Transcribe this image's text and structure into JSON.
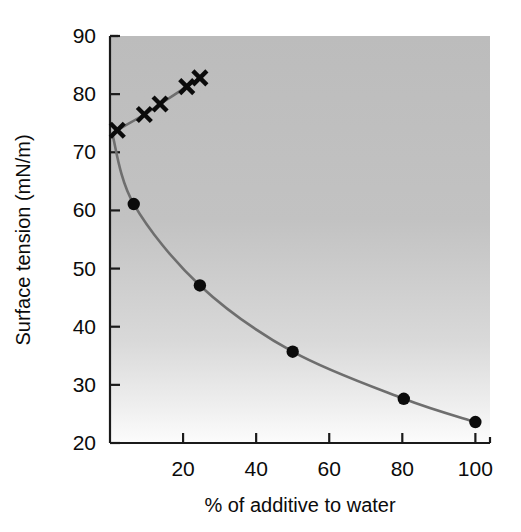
{
  "chart_data": {
    "type": "line",
    "title": "",
    "subtitle": "",
    "xlabel": "% of additive to water",
    "ylabel": "Surface tension (mN/m)",
    "xlim": [
      0,
      104
    ],
    "ylim": [
      20,
      90
    ],
    "xticks": [
      20,
      40,
      60,
      80,
      100
    ],
    "xtick_labels": [
      "20",
      "40",
      "60",
      "80",
      "100"
    ],
    "yticks": [
      20,
      30,
      40,
      50,
      60,
      70,
      80,
      90
    ],
    "ytick_labels": [
      "20",
      "30",
      "40",
      "50",
      "60",
      "70",
      "80",
      "90"
    ],
    "grid": false,
    "legend": null,
    "plot_background": {
      "type": "vertical-gradient",
      "top_color": "#bcbcbc",
      "bottom_color": "#fbfbfb"
    },
    "line_color": "#6e6e6e",
    "marker_color": "#0b0b0b",
    "series": [
      {
        "name": "decreasing-series",
        "marker": "circle",
        "x": [
          0.6,
          6.5,
          24.6,
          50.0,
          80.4,
          100.0
        ],
        "y": [
          73.2,
          61.1,
          47.1,
          35.7,
          27.6,
          23.6
        ]
      },
      {
        "name": "increasing-series",
        "marker": "x",
        "x": [
          0.6,
          2.0,
          9.4,
          13.7,
          21.0,
          24.6
        ],
        "y": [
          73.2,
          73.8,
          76.5,
          78.3,
          81.3,
          82.8
        ]
      }
    ]
  },
  "axis": {
    "x_title": "% of additive to water",
    "y_title": "Surface tension (mN/m)"
  }
}
